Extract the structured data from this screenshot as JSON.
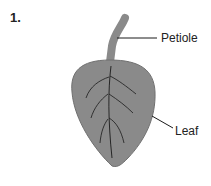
{
  "figure": {
    "number": "1.",
    "labels": {
      "petiole": "Petiole",
      "leaf": "Leaf"
    },
    "colors": {
      "leaf_fill": "#8a8a8a",
      "leaf_outline": "#6a6a6a",
      "veins": "#1a1a1a",
      "leader_lines": "#1a1a1a"
    }
  }
}
